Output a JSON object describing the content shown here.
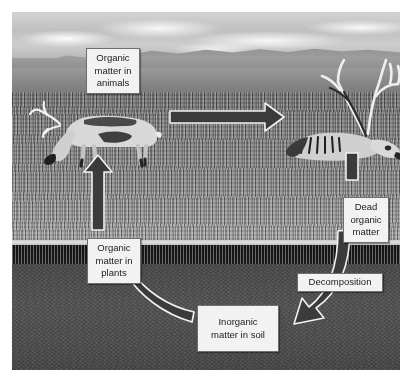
{
  "figure": {
    "kind": "nutrient-cycle-photo-diagram",
    "scene": {
      "description": "Tundra landscape photograph with mountains on the horizon, grass above ground and soil below ground, shown in black and white",
      "layers": [
        {
          "name": "sky",
          "tone": "#c6c6c6"
        },
        {
          "name": "mountain-ridge",
          "tone": "#979797"
        },
        {
          "name": "plain",
          "tone": "#8a8a8a"
        },
        {
          "name": "grass",
          "tone": "#8b8b8b"
        },
        {
          "name": "ground-surface-line",
          "tone": "#dcdcdc"
        },
        {
          "name": "root-zone",
          "tone": "#343434"
        },
        {
          "name": "soil",
          "tone": "#4f4f4f"
        }
      ],
      "subjects": [
        {
          "name": "grazing-caribou",
          "state": "alive, head down grazing"
        },
        {
          "name": "dead-caribou",
          "state": "dead, lying on the ground with antlers"
        }
      ]
    },
    "border_color": "#8a8a8a",
    "arrow_fill": "#3b3b3b",
    "arrow_outline": "#f0f0f0"
  },
  "labels": {
    "organic_matter_in_animals": "Organic\nmatter in\nanimals",
    "dead_organic_matter": "Dead\norganic\nmatter",
    "decomposition": "Decomposition",
    "inorganic_matter_in_soil": "Inorganic\nmatter in soil",
    "organic_matter_in_plants": "Organic\nmatter in\nplants"
  },
  "arrows": [
    {
      "name": "animals-to-dead",
      "from": "organic_matter_in_animals",
      "to": "dead_organic_matter",
      "shape": "straight-horizontal",
      "direction": "right"
    },
    {
      "name": "dead-to-decomp",
      "from": "dead_organic_matter",
      "to": "decomposition",
      "shape": "straight-vertical",
      "direction": "down"
    },
    {
      "name": "decomp-to-soil",
      "from": "decomposition",
      "to": "inorganic_matter_in_soil",
      "shape": "curved",
      "direction": "down-left"
    },
    {
      "name": "soil-to-plants",
      "from": "inorganic_matter_in_soil",
      "to": "organic_matter_in_plants",
      "shape": "curved",
      "direction": "up-left"
    },
    {
      "name": "plants-to-animals",
      "from": "organic_matter_in_plants",
      "to": "organic_matter_in_animals",
      "shape": "straight-vertical",
      "direction": "up"
    }
  ]
}
